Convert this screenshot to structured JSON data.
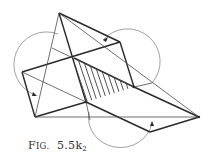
{
  "figure": {
    "caption_prefix": "F",
    "caption_smallcaps": "IG.",
    "caption_number": "5.5k",
    "caption_subscript": "2",
    "colors": {
      "line": "#2a2a2a",
      "arc": "#8a8a8a",
      "background": "#ffffff"
    },
    "vertices": {
      "apex": [
        59,
        13
      ],
      "upper_right_corner": [
        120,
        42
      ],
      "left_corner": [
        22,
        72
      ],
      "bottom_left": [
        35,
        117
      ],
      "right_tip": [
        199,
        117
      ],
      "bottom_corner": [
        150,
        132
      ],
      "hatch_top": [
        74,
        58
      ],
      "hatch_right": [
        134,
        87
      ],
      "hatch_bottom": [
        86,
        102
      ]
    },
    "arcs": [
      "left-rotation-arc",
      "right-rotation-arc",
      "bottom-rotation-arc"
    ],
    "arrows": [
      "left-arc-arrow",
      "right-arc-arrow",
      "bottom-arc-arrow"
    ]
  }
}
